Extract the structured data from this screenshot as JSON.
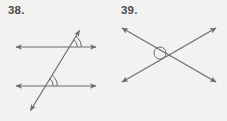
{
  "page": {
    "background_color": "#f2f2f1",
    "line_color": "#6a6a70",
    "label_color": "#4a4a4e",
    "width": 227,
    "height": 121
  },
  "problems": [
    {
      "number_label": "38.",
      "figure_description": "Two parallel lines cut by a transversal, with double arc marks at two corresponding angles",
      "figure_type": "parallel-lines-transversal",
      "lines": [
        {
          "name": "upper-parallel-line",
          "kind": "double-arrow",
          "x1": 14,
          "y1": 47,
          "x2": 98,
          "y2": 47
        },
        {
          "name": "lower-parallel-line",
          "kind": "double-arrow",
          "x1": 14,
          "y1": 86,
          "x2": 98,
          "y2": 86
        },
        {
          "name": "transversal-line",
          "kind": "double-arrow",
          "x1": 29,
          "y1": 113,
          "x2": 81,
          "y2": 28
        }
      ],
      "angle_marks": [
        {
          "name": "upper-angle-arc",
          "center_x": 69,
          "center_y": 47,
          "arcs": 2
        },
        {
          "name": "lower-angle-arc",
          "center_x": 45,
          "center_y": 86,
          "arcs": 2
        }
      ]
    },
    {
      "number_label": "39.",
      "figure_description": "Two intersecting lines forming an X, with a small circle marking the point of intersection",
      "figure_type": "intersecting-lines",
      "lines": [
        {
          "name": "line-up-right",
          "kind": "double-arrow",
          "x1": 7,
          "y1": 84,
          "x2": 105,
          "y2": 26
        },
        {
          "name": "line-down-right",
          "kind": "double-arrow",
          "x1": 7,
          "y1": 26,
          "x2": 105,
          "y2": 84
        }
      ],
      "intersection_mark": {
        "name": "intersection-circle",
        "center_x": 47,
        "center_y": 53,
        "radius": 6
      }
    }
  ]
}
